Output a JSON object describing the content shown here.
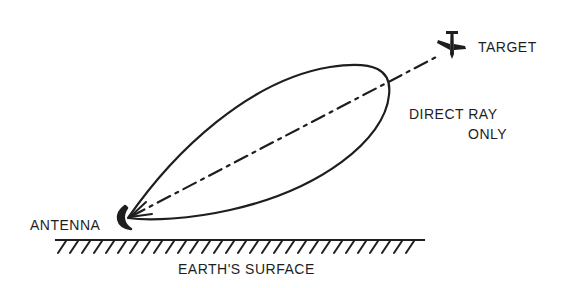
{
  "diagram": {
    "labels": {
      "target": "TARGET",
      "direct_ray_line1": "DIRECT RAY",
      "direct_ray_line2": "ONLY",
      "antenna": "ANTENNA",
      "earth_surface": "EARTH'S SURFACE"
    },
    "icons": {
      "target": "airplane-icon",
      "antenna": "antenna-dish-icon"
    },
    "colors": {
      "ink": "#1e1e1e",
      "background": "#ffffff"
    }
  }
}
